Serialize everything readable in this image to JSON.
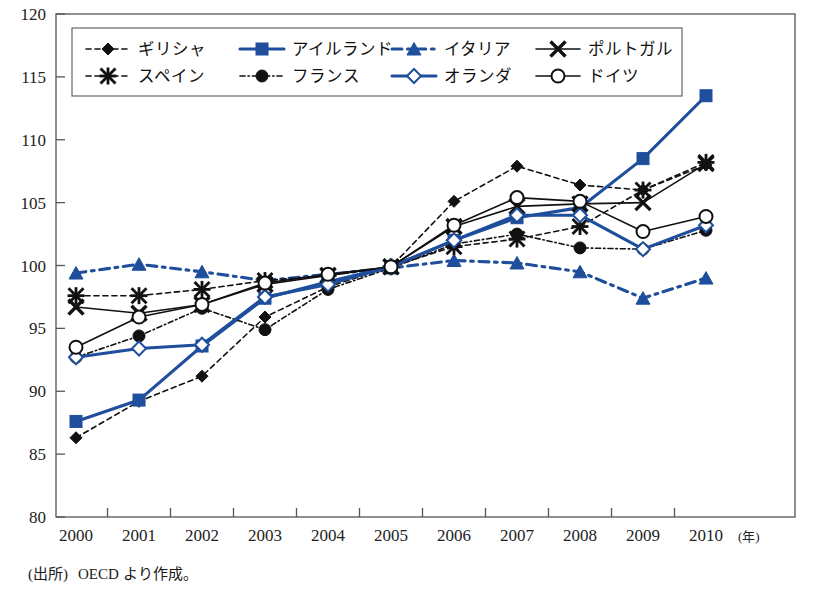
{
  "chart_data": {
    "type": "line",
    "title": "",
    "xlabel": "年",
    "ylabel": "",
    "x": [
      2000,
      2001,
      2002,
      2003,
      2004,
      2005,
      2006,
      2007,
      2008,
      2009,
      2010
    ],
    "xtick_labels": [
      "2000",
      "2001",
      "2002",
      "2003",
      "2004",
      "2005",
      "2006",
      "2007",
      "2008",
      "2009",
      "2010"
    ],
    "x_unit_suffix": "(年)",
    "ylim": [
      80,
      120
    ],
    "ytick_labels": [
      "80",
      "85",
      "90",
      "95",
      "100",
      "105",
      "110",
      "115",
      "120"
    ],
    "yticks": [
      80,
      85,
      90,
      95,
      100,
      105,
      110,
      115,
      120
    ],
    "grid": false,
    "legend_position": "top-left-inside",
    "colors": {
      "blue": "#1F4E9C",
      "black": "#111111",
      "axis": "#555555",
      "background": "#ffffff"
    },
    "series": [
      {
        "name": "ギリシャ",
        "color": "#111111",
        "marker": "diamond-filled",
        "dash": "dashed",
        "values": [
          86.3,
          89.2,
          91.2,
          95.9,
          98.3,
          99.9,
          105.1,
          107.9,
          106.4,
          106.0,
          108.0
        ]
      },
      {
        "name": "アイルランド",
        "color": "#1F4E9C",
        "marker": "square-filled",
        "dash": "solid",
        "values": [
          87.6,
          89.3,
          93.6,
          97.4,
          98.7,
          99.9,
          102.0,
          103.8,
          104.6,
          108.5,
          113.5
        ]
      },
      {
        "name": "イタリア",
        "color": "#1F4E9C",
        "marker": "triangle-filled",
        "dash": "dashdot",
        "values": [
          99.4,
          100.1,
          99.5,
          98.8,
          99.3,
          99.8,
          100.4,
          100.2,
          99.5,
          97.4,
          99.0
        ]
      },
      {
        "name": "ポルトガル",
        "color": "#111111",
        "marker": "cross",
        "dash": "solid",
        "values": [
          96.7,
          96.2,
          96.9,
          98.5,
          99.2,
          99.9,
          103.1,
          104.7,
          104.9,
          105.0,
          108.1
        ]
      },
      {
        "name": "スペイン",
        "color": "#111111",
        "marker": "asterisk",
        "dash": "dashed",
        "values": [
          97.6,
          97.6,
          98.1,
          98.8,
          99.2,
          99.9,
          101.5,
          102.1,
          103.1,
          106.0,
          108.2
        ]
      },
      {
        "name": "フランス",
        "color": "#111111",
        "marker": "circle-filled",
        "dash": "dashdot",
        "values": [
          92.7,
          94.4,
          96.6,
          94.9,
          98.1,
          99.8,
          101.7,
          102.5,
          101.4,
          101.3,
          102.8
        ]
      },
      {
        "name": "オランダ",
        "color": "#1F4E9C",
        "marker": "diamond-open",
        "dash": "solid",
        "values": [
          92.7,
          93.4,
          93.7,
          97.5,
          98.5,
          99.9,
          102.0,
          104.0,
          104.0,
          101.3,
          103.2
        ]
      },
      {
        "name": "ドイツ",
        "color": "#111111",
        "marker": "circle-open",
        "dash": "solid",
        "values": [
          93.5,
          95.9,
          96.9,
          98.6,
          99.3,
          99.9,
          103.2,
          105.4,
          105.1,
          102.7,
          103.9
        ]
      }
    ],
    "legend_rows": [
      [
        "ギリシャ",
        "アイルランド",
        "イタリア",
        "ポルトガル"
      ],
      [
        "スペイン",
        "フランス",
        "オランダ",
        "ドイツ"
      ]
    ]
  },
  "source": {
    "label": "(出所)",
    "text": "OECD より作成。"
  }
}
